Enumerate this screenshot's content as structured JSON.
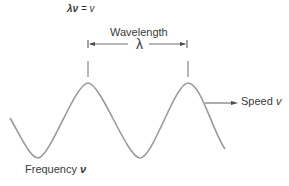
{
  "equation": {
    "lhs": "λν",
    "rest": " = v"
  },
  "labels": {
    "wavelength": "Wavelength",
    "lambda_symbol": "λ",
    "speed": "Speed",
    "speed_symbol": "v",
    "frequency": "Frequency",
    "frequency_symbol": "ν"
  },
  "colors": {
    "wave": "#9a9a9a",
    "lines": "#4a4a4a",
    "text": "#3a3a3a"
  }
}
